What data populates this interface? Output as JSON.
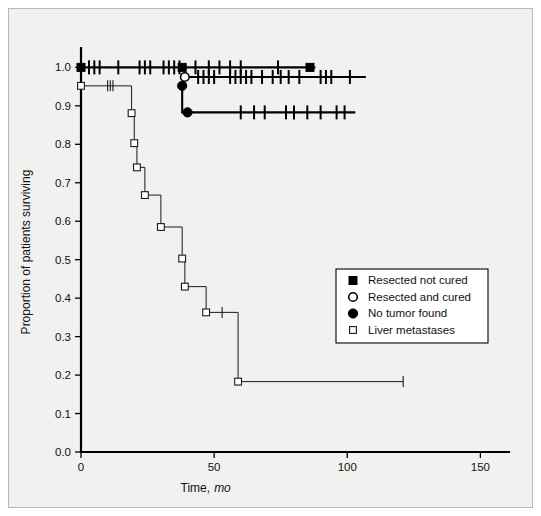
{
  "figure": {
    "background_color": "#f1f1f0",
    "frame_color": "#b8b8b6",
    "ink_color": "#000000"
  },
  "chart_data": {
    "type": "line",
    "title": "",
    "subtitle": "",
    "xlabel": "Time, mo",
    "xlabel_main": "Time,",
    "xlabel_italic": "mo",
    "ylabel": "Proportion of patients surviving",
    "xlim": [
      0,
      160
    ],
    "ylim": [
      0.0,
      1.04
    ],
    "grid": false,
    "legend_position": "center-right",
    "xticks": [
      0,
      50,
      100,
      150
    ],
    "xtick_labels": [
      "0",
      "50",
      "100",
      "150"
    ],
    "yticks": [
      0.0,
      0.1,
      0.2,
      0.3,
      0.4,
      0.5,
      0.6,
      0.7,
      0.8,
      0.9,
      1.0
    ],
    "ytick_labels": [
      "0.0",
      "0.1",
      "0.2",
      "0.3",
      "0.4",
      "0.5",
      "0.6",
      "0.7",
      "0.8",
      "0.9",
      "1.0"
    ],
    "series": [
      {
        "name": "Resected not cured",
        "marker": "filled-square",
        "line_weight": "thick",
        "steps": [
          [
            0,
            1.0
          ],
          [
            88,
            1.0
          ]
        ],
        "markers": [
          [
            0,
            1.0
          ],
          [
            38,
            1.0
          ],
          [
            86,
            1.0
          ]
        ],
        "censor_ticks": [
          3,
          5,
          7,
          14,
          22,
          24,
          26,
          31,
          33,
          35,
          37,
          43,
          48,
          52,
          56,
          60,
          74
        ],
        "censor_level": 1.0
      },
      {
        "name": "Resected and cured",
        "marker": "open-circle",
        "line_weight": "thick",
        "steps": [
          [
            38,
            0.975
          ],
          [
            107,
            0.975
          ]
        ],
        "markers": [
          [
            39,
            0.975
          ]
        ],
        "censor_ticks": [
          44,
          46,
          48,
          50,
          56,
          58,
          60,
          62,
          64,
          68,
          72,
          75,
          78,
          82,
          90,
          92,
          94,
          101
        ],
        "censor_level": 0.975
      },
      {
        "name": "No tumor found",
        "marker": "filled-circle",
        "line_weight": "thick",
        "steps": [
          [
            38,
            0.952
          ],
          [
            38,
            0.883
          ],
          [
            103,
            0.883
          ]
        ],
        "markers": [
          [
            38,
            0.952
          ],
          [
            40,
            0.883
          ]
        ],
        "censor_ticks": [
          60,
          65,
          69,
          77,
          80,
          85,
          90,
          96,
          99
        ],
        "censor_level": 0.883
      },
      {
        "name": "Liver metastases",
        "marker": "open-square",
        "line_weight": "thin",
        "steps": [
          [
            0,
            0.952
          ],
          [
            19,
            0.952
          ],
          [
            19,
            0.881
          ],
          [
            20,
            0.881
          ],
          [
            20,
            0.803
          ],
          [
            21,
            0.803
          ],
          [
            21,
            0.74
          ],
          [
            24,
            0.74
          ],
          [
            24,
            0.668
          ],
          [
            30,
            0.668
          ],
          [
            30,
            0.585
          ],
          [
            38,
            0.585
          ],
          [
            38,
            0.503
          ],
          [
            39,
            0.503
          ],
          [
            39,
            0.43
          ],
          [
            47,
            0.43
          ],
          [
            47,
            0.363
          ],
          [
            59,
            0.363
          ],
          [
            59,
            0.183
          ],
          [
            121,
            0.183
          ]
        ],
        "markers": [
          [
            0,
            0.952
          ],
          [
            19,
            0.881
          ],
          [
            20,
            0.803
          ],
          [
            21,
            0.74
          ],
          [
            24,
            0.668
          ],
          [
            30,
            0.585
          ],
          [
            38,
            0.503
          ],
          [
            39,
            0.43
          ],
          [
            47,
            0.363
          ],
          [
            59,
            0.183
          ]
        ],
        "censor_ticks_points": [
          [
            10,
            0.952
          ],
          [
            11,
            0.952
          ],
          [
            12,
            0.952
          ],
          [
            53,
            0.363
          ],
          [
            121,
            0.183
          ]
        ]
      }
    ]
  },
  "legend": {
    "entries": [
      {
        "label": "Resected not cured",
        "marker": "filled-square"
      },
      {
        "label": "Resected and cured",
        "marker": "open-circle"
      },
      {
        "label": "No tumor found",
        "marker": "filled-circle"
      },
      {
        "label": "Liver metastases",
        "marker": "open-square"
      }
    ]
  }
}
